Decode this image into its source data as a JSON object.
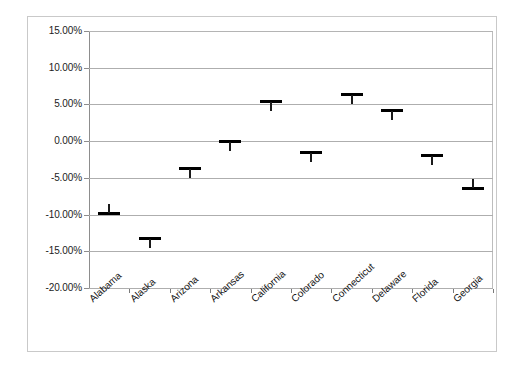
{
  "chart_data": {
    "type": "scatter",
    "title": "",
    "subtitle": "",
    "xlabel": "",
    "ylabel": "",
    "categories": [
      "Alabama",
      "Alaska",
      "Arizona",
      "Arkansas",
      "California",
      "Colorado",
      "Connecticut",
      "Delaware",
      "Florida",
      "Georgia"
    ],
    "values": [
      -9.8,
      -13.2,
      -3.7,
      0.0,
      5.4,
      -1.6,
      6.3,
      4.2,
      -2.0,
      -6.4
    ],
    "series": [
      {
        "name": "Percent change",
        "values": [
          -9.8,
          -13.2,
          -3.7,
          0.0,
          5.4,
          -1.6,
          6.3,
          4.2,
          -2.0,
          -6.4
        ]
      }
    ],
    "stem_direction": [
      "up",
      "down",
      "down",
      "down",
      "down",
      "down",
      "down",
      "down",
      "down",
      "up"
    ],
    "ylim": [
      -20,
      15
    ],
    "ytick_values": [
      15,
      10,
      5,
      0,
      -5,
      -10,
      -15,
      -20
    ],
    "ytick_labels": [
      "15.00%",
      "10.00%",
      "5.00%",
      "0.00%",
      "-5.00%",
      "-10.00%",
      "-15.00%",
      "-20.00%"
    ],
    "grid": true,
    "legend": false,
    "legend_position": "none",
    "annotations": []
  },
  "colors": {
    "marker": "#000000",
    "gridline": "#aeaeae",
    "axis": "#8d8d8d",
    "frame": "#c9c9c9",
    "text": "#1c1c1c",
    "background": "#ffffff"
  }
}
